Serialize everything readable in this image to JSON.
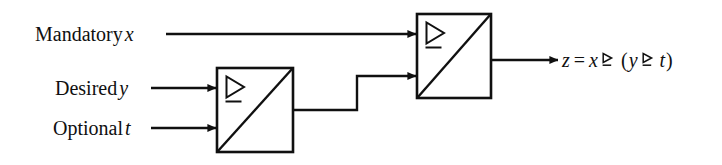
{
  "figure": {
    "background_color": "#ffffff",
    "line_color": "#101010",
    "type": "block-diagram",
    "operator_symbol_name": "contains-as-normal-subgroup-or-equal-triangle"
  },
  "inputs": [
    {
      "id": "x",
      "qualifier": "Mandatory",
      "variable": "x",
      "target": "block-2",
      "port": "top"
    },
    {
      "id": "y",
      "qualifier": "Desired",
      "variable": "y",
      "target": "block-1",
      "port": "top"
    },
    {
      "id": "t",
      "qualifier": "Optional",
      "variable": "t",
      "target": "block-1",
      "port": "bottom"
    }
  ],
  "blocks": [
    {
      "id": "block-1",
      "label": "",
      "symbol": "triangle-underline"
    },
    {
      "id": "block-2",
      "label": "",
      "symbol": "triangle-underline"
    }
  ],
  "output": {
    "result_variable": "z",
    "equals": "=",
    "left_operand": "x",
    "open_paren": "(",
    "inner_left_operand": "y",
    "inner_right_operand": "t",
    "close_paren": ")",
    "expression_text": "z = x ⊵ (y ⊵ t)"
  }
}
